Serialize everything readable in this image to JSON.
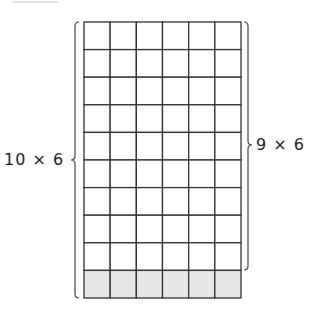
{
  "diagram": {
    "grid": {
      "rows": 10,
      "cols": 6,
      "shaded_rows": [
        10
      ],
      "shade_color": "#e6e6e6",
      "line_color": "#333333"
    },
    "left_label": "10 × 6",
    "right_label": "9 × 6",
    "left_brace_spans_rows": [
      1,
      10
    ],
    "right_brace_spans_rows": [
      1,
      9
    ]
  }
}
